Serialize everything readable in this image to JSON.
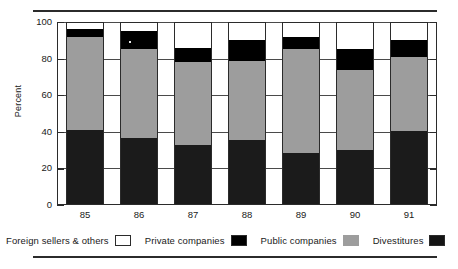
{
  "figure": {
    "title_remnant": "",
    "y_axis_title": "Percent"
  },
  "legend": {
    "items": [
      {
        "label": "Foreign sellers & others",
        "swatch": "white-swatch-icon",
        "color": "#ffffff"
      },
      {
        "label": "Private companies",
        "swatch": "black-swatch-icon",
        "color": "#000000"
      },
      {
        "label": "Public companies",
        "swatch": "gray-swatch-icon",
        "color": "#9d9d9d"
      },
      {
        "label": "Divestitures",
        "swatch": "dark-swatch-icon",
        "color": "#141414"
      }
    ]
  },
  "chart_data": {
    "type": "bar",
    "title": "",
    "xlabel": "",
    "ylabel": "Percent",
    "ylim": [
      0,
      100
    ],
    "yticks": [
      0,
      20,
      40,
      60,
      80,
      100
    ],
    "ytick_labels": [
      "0",
      "20",
      "40",
      "60",
      "80",
      "100"
    ],
    "grid": true,
    "stacked": true,
    "legend_position": "bottom",
    "categories": [
      "85",
      "86",
      "87",
      "88",
      "89",
      "90",
      "91"
    ],
    "series": [
      {
        "name": "Divestitures",
        "color": "#1b1b1b",
        "values": [
          41.0,
          36.5,
          33.0,
          35.5,
          28.5,
          30.0,
          40.5
        ]
      },
      {
        "name": "Public companies",
        "color": "#9d9d9d",
        "values": [
          51.0,
          48.5,
          45.0,
          43.0,
          56.5,
          44.0,
          40.5
        ]
      },
      {
        "name": "Private companies",
        "color": "#000000",
        "values": [
          4.0,
          10.0,
          8.0,
          11.5,
          7.0,
          11.0,
          9.0
        ]
      },
      {
        "name": "Foreign sellers & others",
        "color": "#ffffff",
        "values": [
          4.0,
          5.0,
          14.0,
          10.0,
          8.0,
          15.0,
          10.0
        ]
      }
    ],
    "cumulative_tops": {
      "85": [
        41.0,
        92.0,
        96.0,
        100.0
      ],
      "86": [
        36.5,
        85.0,
        95.0,
        100.0
      ],
      "87": [
        33.0,
        78.0,
        86.0,
        100.0
      ],
      "88": [
        35.5,
        78.5,
        90.0,
        100.0
      ],
      "89": [
        28.5,
        85.0,
        92.0,
        100.0
      ],
      "90": [
        30.0,
        74.0,
        85.0,
        100.0
      ],
      "91": [
        40.5,
        81.0,
        90.0,
        100.0
      ]
    }
  }
}
